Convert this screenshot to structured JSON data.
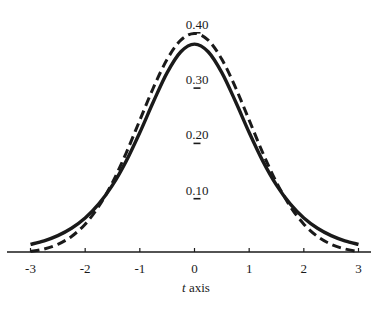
{
  "chart_data": {
    "type": "line",
    "title": "",
    "xlabel": "t axis",
    "xlabel_parts": {
      "var": "t",
      "rest": " axis"
    },
    "ylabel": "",
    "xlim": [
      -3,
      3
    ],
    "ylim": [
      0,
      0.4
    ],
    "grid": false,
    "legend": null,
    "x_ticks": [
      "-3",
      "-2",
      "-1",
      "0",
      "1",
      "2",
      "3"
    ],
    "y_ticks": [
      "0.10",
      "0.20",
      "0.30",
      "0.40"
    ],
    "x": [
      -3,
      -2.75,
      -2.5,
      -2.25,
      -2,
      -1.75,
      -1.5,
      -1.25,
      -1,
      -0.75,
      -0.5,
      -0.25,
      0,
      0.25,
      0.5,
      0.75,
      1,
      1.25,
      1.5,
      1.75,
      2,
      2.25,
      2.5,
      2.75,
      3
    ],
    "series": [
      {
        "name": "t distribution (solid)",
        "style": "solid",
        "color": "#1a1a1a",
        "values": [
          0.0173,
          0.0239,
          0.0333,
          0.0466,
          0.0651,
          0.0905,
          0.1245,
          0.1679,
          0.2197,
          0.2757,
          0.3279,
          0.3657,
          0.3796,
          0.3657,
          0.3279,
          0.2757,
          0.2197,
          0.1679,
          0.1245,
          0.0905,
          0.0651,
          0.0466,
          0.0333,
          0.0239,
          0.0173
        ]
      },
      {
        "name": "standard normal (dashed)",
        "style": "dashed",
        "color": "#1a1a1a",
        "values": [
          0.0044,
          0.0091,
          0.0175,
          0.0317,
          0.054,
          0.0863,
          0.1295,
          0.1826,
          0.242,
          0.3011,
          0.3521,
          0.3867,
          0.3989,
          0.3867,
          0.3521,
          0.3011,
          0.242,
          0.1826,
          0.1295,
          0.0863,
          0.054,
          0.0317,
          0.0175,
          0.0091,
          0.0044
        ]
      }
    ]
  }
}
